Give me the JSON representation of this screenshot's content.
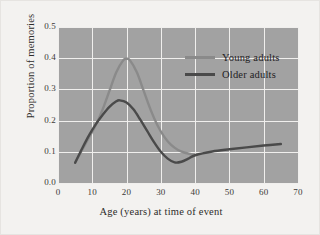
{
  "chart_data": {
    "type": "line",
    "title": "",
    "xlabel": "Age (years) at time of event",
    "ylabel": "Proportion of memories",
    "xlim": [
      0,
      70
    ],
    "ylim": [
      0.0,
      0.5
    ],
    "xticks": [
      "0",
      "10",
      "20",
      "30",
      "40",
      "50",
      "60",
      "70"
    ],
    "xtick_values": [
      0,
      10,
      20,
      30,
      40,
      50,
      60,
      70
    ],
    "yticks": [
      "0.0",
      "0.1",
      "0.2",
      "0.3",
      "0.4",
      "0.5"
    ],
    "ytick_values": [
      0.0,
      0.1,
      0.2,
      0.3,
      0.4,
      0.5
    ],
    "grid": true,
    "legend_position": "upper-right",
    "plot_background": "#a2a2a2",
    "grid_color": "#f0efed",
    "series": [
      {
        "name": "Young adults",
        "color": "#8a8a8a",
        "x": [
          5,
          7,
          9,
          11,
          13,
          15,
          17,
          19,
          20,
          21,
          23,
          25,
          27,
          29,
          31,
          33,
          35,
          37,
          39,
          40
        ],
        "values": [
          0.065,
          0.105,
          0.145,
          0.185,
          0.235,
          0.295,
          0.355,
          0.393,
          0.398,
          0.393,
          0.355,
          0.295,
          0.235,
          0.185,
          0.148,
          0.122,
          0.106,
          0.097,
          0.092,
          0.09
        ]
      },
      {
        "name": "Older adults",
        "color": "#4a4a4a",
        "x": [
          5,
          7,
          9,
          11,
          13,
          15,
          17,
          18,
          20,
          22,
          24,
          26,
          28,
          30,
          32,
          34,
          36,
          38,
          40,
          45,
          50,
          55,
          60,
          65
        ],
        "values": [
          0.065,
          0.11,
          0.152,
          0.188,
          0.218,
          0.244,
          0.262,
          0.265,
          0.258,
          0.236,
          0.203,
          0.167,
          0.131,
          0.1,
          0.078,
          0.066,
          0.068,
          0.078,
          0.089,
          0.101,
          0.108,
          0.114,
          0.12,
          0.125
        ]
      }
    ]
  },
  "legend": {
    "entries": [
      {
        "label": "Young adults",
        "color": "#8a8a8a"
      },
      {
        "label": "Older adults",
        "color": "#4a4a4a"
      }
    ]
  }
}
